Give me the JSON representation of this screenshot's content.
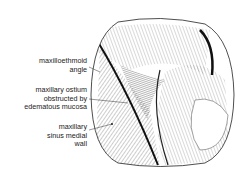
{
  "figure": {
    "labels": [
      {
        "id": "maxilloethmoid-angle",
        "text": "maxilloethmoid\nangle"
      },
      {
        "id": "maxillary-ostium",
        "text": "maxillary ostium\nobstructed by\nedematous mucosa"
      },
      {
        "id": "maxillary-sinus-medial-wall",
        "text": "maxillary\nsinus medial\nwall"
      }
    ]
  }
}
